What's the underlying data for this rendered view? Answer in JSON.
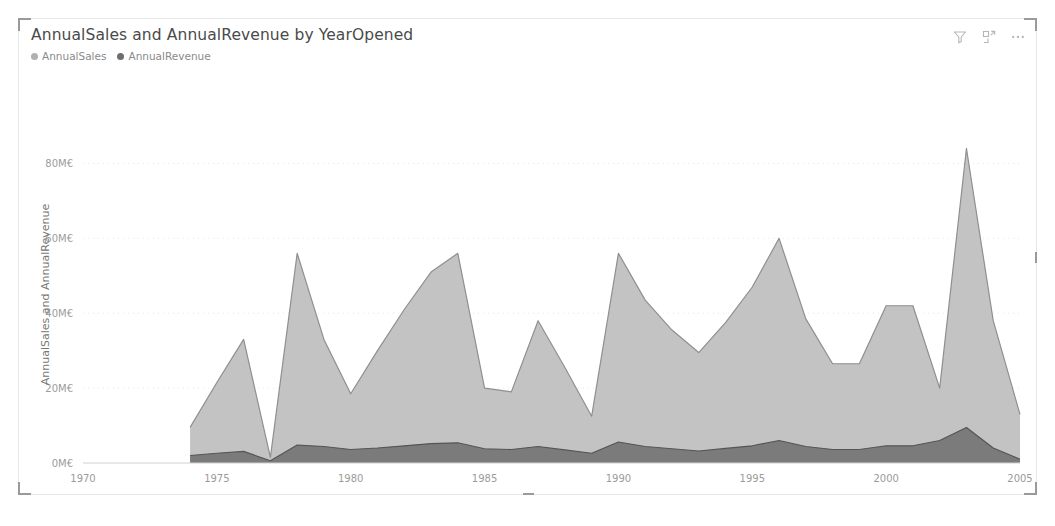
{
  "visual": {
    "title": "AnnualSales and AnnualRevenue by YearOpened",
    "header_icons": [
      {
        "name": "filter-icon",
        "label": "Filters"
      },
      {
        "name": "focus-mode-icon",
        "label": "Focus mode"
      },
      {
        "name": "more-options-icon",
        "label": "More options"
      }
    ]
  },
  "legend": {
    "items": [
      {
        "label": "AnnualSales",
        "color": "#b0b0b0"
      },
      {
        "label": "AnnualRevenue",
        "color": "#6e6e6e"
      }
    ]
  },
  "chart_data": {
    "type": "area",
    "title": "AnnualSales and AnnualRevenue by YearOpened",
    "xlabel": "YearOpened",
    "ylabel": "AnnualSales and AnnualRevenue",
    "xlim": [
      1970,
      2005
    ],
    "ylim": [
      0,
      90
    ],
    "grid": true,
    "legend_position": "top-left",
    "overlap": true,
    "value_unit": "M€",
    "x_tick_labels": [
      "1970",
      "1975",
      "1980",
      "1985",
      "1990",
      "1995",
      "2000",
      "2005"
    ],
    "x_tick_values": [
      1970,
      1975,
      1980,
      1985,
      1990,
      1995,
      2000,
      2005
    ],
    "y_tick_labels": [
      "0M€",
      "20M€",
      "40M€",
      "60M€",
      "80M€"
    ],
    "y_tick_values": [
      0,
      20,
      40,
      60,
      80
    ],
    "x": [
      1974,
      1975,
      1976,
      1977,
      1978,
      1979,
      1980,
      1981,
      1982,
      1983,
      1984,
      1985,
      1986,
      1987,
      1988,
      1989,
      1990,
      1991,
      1992,
      1993,
      1994,
      1995,
      1996,
      1997,
      1998,
      1999,
      2000,
      2001,
      2002,
      2003,
      2004,
      2005
    ],
    "series": [
      {
        "name": "AnnualSales",
        "color": "#b8b8b8",
        "values": [
          9.5,
          21.5,
          33.0,
          1.5,
          56.0,
          33.0,
          18.5,
          30.0,
          41.0,
          51.0,
          56.0,
          20.0,
          19.0,
          38.0,
          25.5,
          12.5,
          56.0,
          43.5,
          35.5,
          29.5,
          37.5,
          47.0,
          60.0,
          38.5,
          26.5,
          26.5,
          42.0,
          42.0,
          20.0,
          84.0,
          38.0,
          13.0
        ]
      },
      {
        "name": "AnnualRevenue",
        "color": "#6e6e6e",
        "values": [
          2.0,
          2.6,
          3.1,
          0.6,
          4.8,
          4.4,
          3.6,
          4.0,
          4.6,
          5.2,
          5.4,
          3.8,
          3.6,
          4.4,
          3.5,
          2.6,
          5.6,
          4.4,
          3.8,
          3.2,
          3.9,
          4.6,
          6.0,
          4.4,
          3.6,
          3.6,
          4.6,
          4.6,
          6.0,
          9.5,
          4.0,
          1.0
        ]
      }
    ]
  }
}
